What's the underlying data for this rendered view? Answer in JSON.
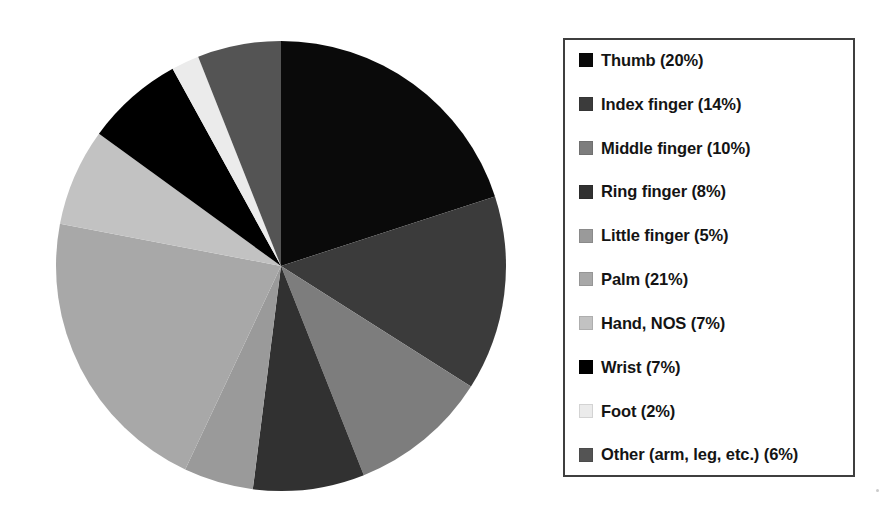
{
  "chart_data": {
    "type": "pie",
    "title": "",
    "subtitle": "",
    "xlabel": "",
    "ylabel": "",
    "grid": false,
    "legend_position": "right",
    "start_angle_deg": 0,
    "direction": "clockwise",
    "total_percent": 100,
    "categories": [
      "Thumb",
      "Index finger",
      "Middle finger",
      "Ring finger",
      "Little finger",
      "Palm",
      "Hand, NOS",
      "Wrist",
      "Foot",
      "Other (arm, leg, etc.)"
    ],
    "values": [
      20,
      14,
      10,
      8,
      5,
      21,
      7,
      7,
      2,
      6
    ],
    "value_labels": [
      "20%",
      "14%",
      "10%",
      "8%",
      "5%",
      "21%",
      "7%",
      "7%",
      "2%",
      "6%"
    ],
    "colors": [
      "#0a0a0a",
      "#3b3b3b",
      "#7d7d7d",
      "#313131",
      "#9a9a9a",
      "#a8a8a8",
      "#c2c2c2",
      "#000000",
      "#ebebeb",
      "#545454"
    ],
    "slices": [
      {
        "label": "Thumb",
        "value": 20,
        "label_with_value": "Thumb (20%)",
        "color": "#0a0a0a"
      },
      {
        "label": "Index finger",
        "value": 14,
        "label_with_value": "Index finger (14%)",
        "color": "#3b3b3b"
      },
      {
        "label": "Middle finger",
        "value": 10,
        "label_with_value": "Middle finger (10%)",
        "color": "#7d7d7d"
      },
      {
        "label": "Ring finger",
        "value": 8,
        "label_with_value": "Ring finger (8%)",
        "color": "#313131"
      },
      {
        "label": "Little finger",
        "value": 5,
        "label_with_value": "Little finger (5%)",
        "color": "#9a9a9a"
      },
      {
        "label": "Palm",
        "value": 21,
        "label_with_value": "Palm (21%)",
        "color": "#a8a8a8"
      },
      {
        "label": "Hand, NOS",
        "value": 7,
        "label_with_value": "Hand, NOS (7%)",
        "color": "#c2c2c2"
      },
      {
        "label": "Wrist",
        "value": 7,
        "label_with_value": "Wrist (7%)",
        "color": "#000000"
      },
      {
        "label": "Foot",
        "value": 2,
        "label_with_value": "Foot (2%)",
        "color": "#ebebeb"
      },
      {
        "label": "Other (arm, leg, etc.)",
        "value": 6,
        "label_with_value": "Other (arm, leg, etc.) (6%)",
        "color": "#545454"
      }
    ]
  },
  "legend": {
    "items": [
      {
        "label": "Thumb (20%)",
        "color": "#0a0a0a",
        "swatch_icon": "legend-swatch-icon"
      },
      {
        "label": "Index finger (14%)",
        "color": "#3b3b3b",
        "swatch_icon": "legend-swatch-icon"
      },
      {
        "label": "Middle finger (10%)",
        "color": "#7d7d7d",
        "swatch_icon": "legend-swatch-icon"
      },
      {
        "label": "Ring finger (8%)",
        "color": "#313131",
        "swatch_icon": "legend-swatch-icon"
      },
      {
        "label": "Little finger (5%)",
        "color": "#9a9a9a",
        "swatch_icon": "legend-swatch-icon"
      },
      {
        "label": "Palm (21%)",
        "color": "#a8a8a8",
        "swatch_icon": "legend-swatch-icon"
      },
      {
        "label": "Hand, NOS (7%)",
        "color": "#c2c2c2",
        "swatch_icon": "legend-swatch-icon"
      },
      {
        "label": "Wrist (7%)",
        "color": "#000000",
        "swatch_icon": "legend-swatch-icon"
      },
      {
        "label": "Foot (2%)",
        "color": "#ebebeb",
        "swatch_icon": "legend-swatch-icon"
      },
      {
        "label": "Other (arm, leg, etc.) (6%)",
        "color": "#545454",
        "swatch_icon": "legend-swatch-icon"
      }
    ],
    "border_color": "#3f3f3f"
  },
  "geometry": {
    "center_x": 226,
    "center_y": 226,
    "radius": 225
  }
}
